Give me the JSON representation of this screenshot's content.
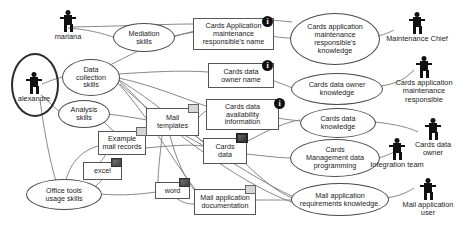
{
  "diagram": {
    "background_color": "#ffffff",
    "line_color": "#7a7a7a",
    "text_color": "#1b1b1b"
  },
  "actors": [
    {
      "id": "mariana",
      "label": "mariana",
      "icon": "actor-person-icon",
      "x": 48,
      "y": 10,
      "w": 40,
      "highlighted": false
    },
    {
      "id": "alexandre",
      "label": "alexandre",
      "icon": "actor-person-icon",
      "x": 12,
      "y": 72,
      "w": 44,
      "highlighted": true,
      "highlight": {
        "x": 11,
        "y": 53,
        "w": 44,
        "h": 60
      }
    },
    {
      "id": "maintenance-chief",
      "label": "Maintenance Chief",
      "icon": "actor-person-icon",
      "x": 372,
      "y": 12,
      "w": 90,
      "highlighted": false
    },
    {
      "id": "cards-application-maintenance-responsible",
      "label": "Cards application\nmaintenance\nresponsible",
      "icon": "actor-person-icon",
      "x": 382,
      "y": 56,
      "w": 84,
      "highlighted": false
    },
    {
      "id": "cards-data-owner",
      "label": "Cards data\nowner",
      "icon": "actor-person-icon",
      "x": 400,
      "y": 118,
      "w": 66,
      "highlighted": false
    },
    {
      "id": "integration-team",
      "label": "Integration team",
      "icon": "actor-person-icon",
      "x": 356,
      "y": 138,
      "w": 82,
      "highlighted": false
    },
    {
      "id": "mail-application-user",
      "label": "Mail application\nuser",
      "icon": "actor-person-icon",
      "x": 390,
      "y": 178,
      "w": 76,
      "highlighted": false
    }
  ],
  "ellipses": [
    {
      "id": "mediation-skills",
      "label": "Mediation\nskills",
      "x": 113,
      "y": 23,
      "w": 62,
      "h": 29
    },
    {
      "id": "data-collection-skills",
      "label": "Data\ncollection\nskills",
      "x": 62,
      "y": 59,
      "w": 58,
      "h": 37
    },
    {
      "id": "analysis-skills",
      "label": "Analysis\nskills",
      "x": 58,
      "y": 100,
      "w": 52,
      "h": 28
    },
    {
      "id": "office-tools-usage-skills",
      "label": "Office tools\nusage skills",
      "x": 26,
      "y": 179,
      "w": 76,
      "h": 31
    },
    {
      "id": "cards-application-maintenance-responsibles-knowledge",
      "label": "Cards application\nmaintenance\nresponsible's\nknowledge",
      "x": 290,
      "y": 13,
      "w": 90,
      "h": 52
    },
    {
      "id": "cards-data-owner-knowledge",
      "label": "Cards data owner\nknowledge",
      "x": 291,
      "y": 73,
      "w": 92,
      "h": 32
    },
    {
      "id": "cards-data-knowledge",
      "label": "Cards data\nknowledge",
      "x": 300,
      "y": 108,
      "w": 76,
      "h": 30
    },
    {
      "id": "cards-management-data-programming",
      "label": "Cards\nManagement data\nprogramming",
      "x": 290,
      "y": 139,
      "w": 90,
      "h": 38
    },
    {
      "id": "mail-application-requirements-knowledge",
      "label": "Mail application\nrequirements knowledge.",
      "x": 291,
      "y": 183,
      "w": 98,
      "h": 33
    }
  ],
  "rectangles": [
    {
      "id": "cards-application-maintenance-responsibles-name",
      "label": "Cards Application\nmaintenance\nresponsible's name",
      "x": 193,
      "y": 18,
      "w": 81,
      "h": 32,
      "badge": {
        "type": "info",
        "label": "i",
        "x": 262,
        "y": 16
      }
    },
    {
      "id": "cards-data-owner-name",
      "label": "Cards data\nowner name",
      "x": 208,
      "y": 63,
      "w": 66,
      "h": 25,
      "badge": {
        "type": "info",
        "label": "i",
        "x": 262,
        "y": 60
      }
    },
    {
      "id": "cards-data-availability-information",
      "label": "Cards data\navailability\ninformation",
      "x": 206,
      "y": 99,
      "w": 73,
      "h": 31,
      "badge": {
        "type": "info",
        "label": "i",
        "x": 274,
        "y": 98
      }
    },
    {
      "id": "mail-templates",
      "label": "Mail\ntemplates",
      "x": 146,
      "y": 108,
      "w": 53,
      "h": 28,
      "badge": {
        "type": "light",
        "x": 188,
        "y": 104,
        "w": 11,
        "h": 9
      }
    },
    {
      "id": "example-mail-records",
      "label": "Example\nmail records",
      "x": 98,
      "y": 131,
      "w": 48,
      "h": 24,
      "badge": {
        "type": "light",
        "x": 136,
        "y": 127,
        "w": 11,
        "h": 9
      }
    },
    {
      "id": "cards-data",
      "label": "Cards\ndata",
      "x": 203,
      "y": 138,
      "w": 44,
      "h": 26,
      "badge": {
        "type": "dark",
        "x": 236,
        "y": 133,
        "w": 12,
        "h": 10
      }
    },
    {
      "id": "excel",
      "label": "excel",
      "x": 83,
      "y": 162,
      "w": 39,
      "h": 18,
      "badge": {
        "type": "mid",
        "x": 111,
        "y": 158,
        "w": 11,
        "h": 9
      }
    },
    {
      "id": "word",
      "label": "word",
      "x": 155,
      "y": 182,
      "w": 35,
      "h": 17,
      "badge": {
        "type": "mid",
        "x": 179,
        "y": 178,
        "w": 11,
        "h": 9
      }
    },
    {
      "id": "mail-application-documentation",
      "label": "Mail application\ndocumentation",
      "x": 194,
      "y": 189,
      "w": 62,
      "h": 26,
      "badge": {
        "type": "light",
        "x": 245,
        "y": 185,
        "w": 11,
        "h": 9
      }
    }
  ],
  "edges": [
    {
      "from": "mariana",
      "to": "mediation-skills",
      "d": "M 68,28 C 92,30 104,34 116,38"
    },
    {
      "from": "mariana",
      "to": "cards-application-maintenance-responsibles-name",
      "d": "M 70,27 C 130,26 166,24 194,24"
    },
    {
      "from": "mediation-skills",
      "to": "cards-application-maintenance-responsibles-knowledge",
      "d": "M 174,36 C 210,28 244,16 292,22"
    },
    {
      "from": "alexandre",
      "to": "data-collection-skills",
      "d": "M 42,84 C 52,80 58,78 66,76"
    },
    {
      "from": "alexandre",
      "to": "analysis-skills",
      "d": "M 41,95 C 48,100 52,106 60,112"
    },
    {
      "from": "alexandre",
      "to": "office-tools-usage-skills",
      "d": "M 40,100 C 44,130 50,162 56,181"
    },
    {
      "from": "data-collection-skills",
      "to": "cards-data-owner-name",
      "d": "M 118,74 C 150,72 180,70 208,72"
    },
    {
      "from": "data-collection-skills",
      "to": "cards-data-availability-information",
      "d": "M 119,78 C 155,86 182,98 206,106"
    },
    {
      "from": "data-collection-skills",
      "to": "mail-templates",
      "d": "M 118,80 C 132,92 140,102 148,110"
    },
    {
      "from": "data-collection-skills",
      "to": "cards-data",
      "d": "M 119,80 C 156,102 182,128 204,142"
    },
    {
      "from": "data-collection-skills",
      "to": "mail-application-documentation",
      "d": "M 117,82 C 150,118 176,166 196,190"
    },
    {
      "from": "data-collection-skills",
      "to": "cards-application-maintenance-responsibles-name",
      "d": "M 112,64 C 140,50 166,36 194,32"
    },
    {
      "from": "analysis-skills",
      "to": "mail-templates",
      "d": "M 108,114 C 124,116 136,118 147,120"
    },
    {
      "from": "analysis-skills",
      "to": "example-mail-records",
      "d": "M 104,122 C 110,128 114,132 120,136"
    },
    {
      "from": "example-mail-records",
      "to": "mail-templates",
      "d": "M 144,138 C 150,132 152,128 154,124"
    },
    {
      "from": "example-mail-records",
      "to": "excel",
      "d": "M 106,154 C 104,158 102,160 100,162"
    },
    {
      "from": "example-mail-records",
      "to": "cards-data",
      "d": "M 145,148 C 170,146 188,144 203,146"
    },
    {
      "from": "office-tools-usage-skills",
      "to": "excel",
      "d": "M 96,186 C 104,178 108,172 112,168"
    },
    {
      "from": "office-tools-usage-skills",
      "to": "word",
      "d": "M 100,194 C 124,196 142,194 156,192"
    },
    {
      "from": "office-tools-usage-skills",
      "to": "example-mail-records",
      "d": "M 66,180 C 70,166 78,152 98,146"
    },
    {
      "from": "mail-templates",
      "to": "cards-data-availability-information",
      "d": "M 198,118 C 202,114 204,112 206,111"
    },
    {
      "from": "mail-templates",
      "to": "mail-application-documentation",
      "d": "M 170,136 C 176,158 184,178 196,192"
    },
    {
      "from": "mail-templates",
      "to": "word",
      "d": "M 162,136 C 160,156 158,172 158,182"
    },
    {
      "from": "mail-templates",
      "to": "mail-application-requirements-knowledge",
      "d": "M 186,136 C 230,160 268,186 292,196"
    },
    {
      "from": "cards-data",
      "to": "cards-management-data-programming",
      "d": "M 246,154 C 266,156 280,158 292,158"
    },
    {
      "from": "cards-data",
      "to": "cards-data-knowledge",
      "d": "M 246,142 C 268,130 286,122 300,120"
    },
    {
      "from": "cards-data",
      "to": "mail-application-requirements-knowledge",
      "d": "M 244,162 C 262,180 278,192 292,198"
    },
    {
      "from": "cards-data-availability-information",
      "to": "cards-data-knowledge",
      "d": "M 278,118 C 288,120 294,120 300,121"
    },
    {
      "from": "cards-data-owner-name",
      "to": "cards-data-owner-knowledge",
      "d": "M 272,80 C 282,84 288,86 292,88"
    },
    {
      "from": "cards-application-maintenance-responsibles-name",
      "to": "cards-application-maintenance-responsibles-knowledge",
      "d": "M 272,36 C 282,38 288,38 292,38"
    },
    {
      "from": "cards-application-maintenance-responsibles-knowledge",
      "to": "maintenance-chief",
      "d": "M 378,36 C 386,34 390,32 394,30"
    },
    {
      "from": "cards-data-owner-knowledge",
      "to": "cards-application-maintenance-responsible",
      "d": "M 380,86 C 398,84 406,78 414,70"
    },
    {
      "from": "cards-data-knowledge",
      "to": "cards-data-owner",
      "d": "M 374,122 C 396,124 410,128 418,132"
    },
    {
      "from": "cards-management-data-programming",
      "to": "integration-team",
      "d": "M 378,158 C 386,156 390,154 394,152"
    },
    {
      "from": "mail-application-requirements-knowledge",
      "to": "mail-application-user",
      "d": "M 386,198 C 400,196 408,192 414,188"
    },
    {
      "from": "mail-application-documentation",
      "to": "mail-application-requirements-knowledge",
      "d": "M 254,200 C 272,200 282,200 292,200"
    },
    {
      "from": "word",
      "to": "mail-application-documentation",
      "d": "M 176,198 C 182,202 186,204 194,204"
    },
    {
      "from": "mail-templates",
      "to": "cards-data",
      "d": "M 194,134 C 198,138 200,140 203,142"
    },
    {
      "from": "data-collection-skills",
      "to": "mail-application-requirements-knowledge",
      "d": "M 120,84 C 180,140 250,188 292,202"
    }
  ]
}
